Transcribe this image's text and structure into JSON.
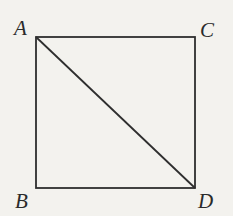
{
  "diagram": {
    "type": "geometry",
    "shape": "square",
    "stroke_color": "#2e2e2e",
    "background_color": "#f3f2ee",
    "vertices": {
      "A": {
        "label": "A",
        "x": 36,
        "y": 37
      },
      "C": {
        "label": "C",
        "x": 195,
        "y": 37
      },
      "B": {
        "label": "B",
        "x": 36,
        "y": 188
      },
      "D": {
        "label": "D",
        "x": 195,
        "y": 188
      }
    },
    "segments": [
      {
        "from": "A",
        "to": "C"
      },
      {
        "from": "C",
        "to": "D"
      },
      {
        "from": "D",
        "to": "B"
      },
      {
        "from": "B",
        "to": "A"
      },
      {
        "from": "A",
        "to": "D",
        "kind": "diagonal"
      }
    ]
  }
}
